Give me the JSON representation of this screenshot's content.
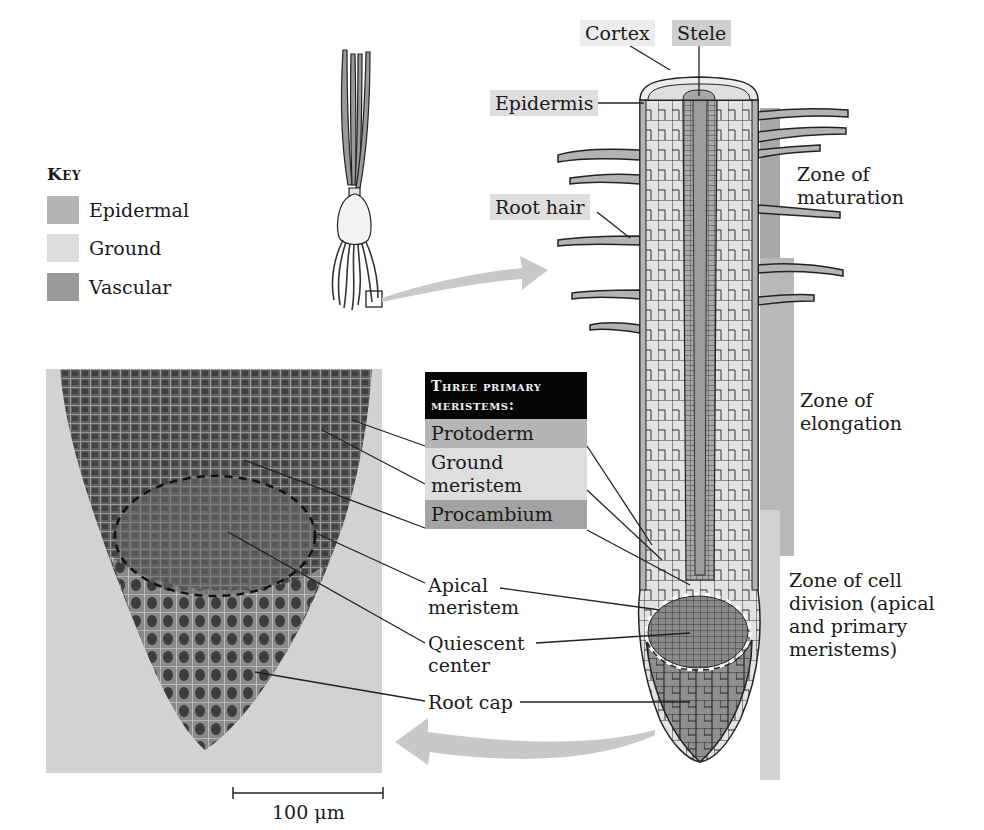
{
  "key": {
    "title": "Key",
    "items": [
      {
        "label": "Epidermal",
        "color": "#b3b3b3"
      },
      {
        "label": "Ground",
        "color": "#dcdcdc"
      },
      {
        "label": "Vascular",
        "color": "#9a9a9a"
      }
    ]
  },
  "root_labels": {
    "cortex": "Cortex",
    "stele": "Stele",
    "epidermis": "Epidermis",
    "root_hair": "Root hair"
  },
  "meristems_box": {
    "title_line1": "Three primary",
    "title_line2": "meristems:",
    "items": [
      {
        "label": "Protoderm",
        "color": "#b5b5b5"
      },
      {
        "label_line1": "Ground",
        "label_line2": "meristem",
        "color": "#dedede"
      },
      {
        "label": "Procambium",
        "color": "#a3a3a3"
      }
    ]
  },
  "micrograph_labels": {
    "apical_meristem_line1": "Apical",
    "apical_meristem_line2": "meristem",
    "quiescent_center_line1": "Quiescent",
    "quiescent_center_line2": "center",
    "root_cap": "Root cap"
  },
  "zones": {
    "maturation_line1": "Zone of",
    "maturation_line2": "maturation",
    "elongation_line1": "Zone of",
    "elongation_line2": "elongation",
    "cell_division_line1": "Zone of cell",
    "cell_division_line2": "division (apical",
    "cell_division_line3": "and primary",
    "cell_division_line4": "meristems)"
  },
  "scale_bar": {
    "label": "100 μm"
  },
  "colors": {
    "epidermal": "#b3b3b3",
    "ground": "#dcdcdc",
    "vascular": "#9a9a9a",
    "arrow": "#c8c8c8",
    "micrograph_bg": "#d2d2d2"
  }
}
